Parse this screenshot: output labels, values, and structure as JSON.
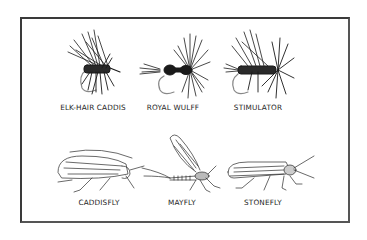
{
  "figure": {
    "top_row": {
      "items": [
        {
          "label": "ELK-HAIR CADDIS",
          "icon": "elk-hair-caddis-fly-icon"
        },
        {
          "label": "ROYAL WULFF",
          "icon": "royal-wulff-fly-icon"
        },
        {
          "label": "STIMULATOR",
          "icon": "stimulator-fly-icon"
        }
      ]
    },
    "bottom_row": {
      "items": [
        {
          "label": "CADDISFLY",
          "icon": "caddisfly-insect-icon"
        },
        {
          "label": "MAYFLY",
          "icon": "mayfly-insect-icon"
        },
        {
          "label": "STONEFLY",
          "icon": "stonefly-insect-icon"
        }
      ]
    },
    "colors": {
      "ink": "#1e1e1e",
      "frame": "#3a3a3a",
      "background": "#ffffff"
    }
  }
}
